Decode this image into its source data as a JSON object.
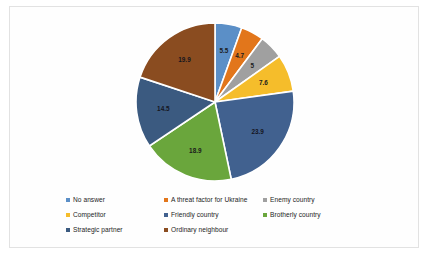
{
  "chart_data": {
    "type": "pie",
    "title": "",
    "legend_position": "bottom",
    "categories": [
      "No answer",
      "A threat factor for Ukraine",
      "Enemy country",
      "Competitor",
      "Friendly country",
      "Brotherly country",
      "Strategic partner",
      "Ordinary neighbour"
    ],
    "values": [
      5.5,
      4.7,
      5,
      7.6,
      23.9,
      18.9,
      14.5,
      19.9
    ],
    "value_labels": [
      "5.5",
      "4.7",
      "5",
      "7.6",
      "23.9",
      "18.9",
      "14.5",
      "19.9"
    ],
    "colors": [
      "#5b8fc7",
      "#e2761b",
      "#a0a0a0",
      "#f5bd2b",
      "#41618f",
      "#6aa63c",
      "#3b5a80",
      "#8a4c20"
    ]
  },
  "legend": {
    "rows": [
      [
        {
          "label": "No answer",
          "color": "#5b8fc7"
        },
        {
          "label": "A threat factor for Ukraine",
          "color": "#e2761b"
        },
        {
          "label": "Enemy country",
          "color": "#a0a0a0"
        }
      ],
      [
        {
          "label": "Competitor",
          "color": "#f5bd2b"
        },
        {
          "label": "Friendly country",
          "color": "#41618f"
        },
        {
          "label": "Brotherly country",
          "color": "#6aa63c"
        }
      ],
      [
        {
          "label": "Strategic partner",
          "color": "#3b5a80"
        },
        {
          "label": "Ordinary neighbour",
          "color": "#8a4c20"
        }
      ]
    ]
  }
}
